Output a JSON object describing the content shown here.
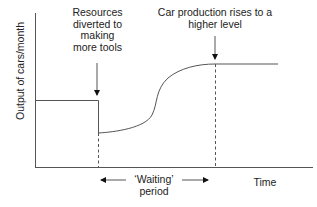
{
  "diagram": {
    "type": "line-annotated",
    "y_axis_label": "Output of cars/month",
    "x_axis_label": "Time",
    "annotations": {
      "resources": [
        "Resources",
        "diverted to",
        "making",
        "more tools"
      ],
      "rise": [
        "Car production rises to a",
        "higher level"
      ],
      "waiting": [
        "‘Waiting’",
        "period"
      ]
    },
    "colors": {
      "line": "#555555",
      "text": "#222222"
    }
  }
}
